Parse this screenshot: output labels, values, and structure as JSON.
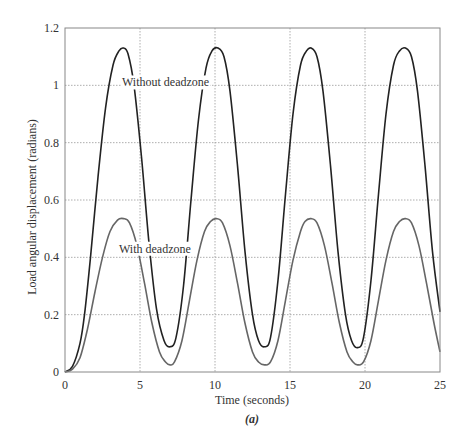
{
  "chart_data": {
    "type": "line",
    "title": "",
    "caption": "(a)",
    "xlabel": "Time (seconds)",
    "ylabel": "Load angular displacement (radians)",
    "xlim": [
      0,
      25
    ],
    "ylim": [
      0,
      1.2
    ],
    "xticks": [
      0,
      5,
      10,
      15,
      20,
      25
    ],
    "xtick_labels": [
      "0",
      "5",
      "10",
      "15",
      "20",
      "25"
    ],
    "yticks": [
      0,
      0.2,
      0.4,
      0.6,
      0.8,
      1.0,
      1.2
    ],
    "ytick_labels": [
      "0",
      "0.2",
      "0.4",
      "0.6",
      "0.8",
      "1",
      "1.2"
    ],
    "grid": true,
    "legend": "inline annotations",
    "annotations": [
      {
        "text": "Without deadzone",
        "x": 3.8,
        "y": 1.01
      },
      {
        "text": "With deadzone",
        "x": 3.6,
        "y": 0.43
      }
    ],
    "series": [
      {
        "name": "Without deadzone",
        "color": "#222222",
        "x": [
          0,
          0.5,
          1.0,
          1.3,
          1.7,
          2.2,
          2.7,
          3.2,
          3.6,
          3.9,
          4.2,
          4.6,
          5.1,
          5.6,
          6.1,
          6.6,
          7.0,
          7.4,
          7.9,
          8.4,
          8.9,
          9.4,
          9.8,
          10.2,
          10.6,
          11.0,
          11.5,
          12.0,
          12.5,
          12.9,
          13.3,
          13.7,
          14.2,
          14.7,
          15.2,
          15.7,
          16.1,
          16.4,
          16.8,
          17.2,
          17.7,
          18.2,
          18.7,
          19.1,
          19.5,
          19.9,
          20.4,
          20.9,
          21.4,
          21.9,
          22.3,
          22.7,
          23.1,
          23.5,
          24.0,
          24.5,
          25.0
        ],
        "y": [
          0,
          0.02,
          0.1,
          0.2,
          0.4,
          0.68,
          0.92,
          1.07,
          1.12,
          1.13,
          1.11,
          1.0,
          0.75,
          0.45,
          0.22,
          0.11,
          0.088,
          0.12,
          0.3,
          0.6,
          0.88,
          1.06,
          1.12,
          1.13,
          1.1,
          0.98,
          0.72,
          0.42,
          0.2,
          0.11,
          0.088,
          0.12,
          0.32,
          0.62,
          0.9,
          1.07,
          1.12,
          1.13,
          1.1,
          0.98,
          0.72,
          0.42,
          0.2,
          0.11,
          0.085,
          0.12,
          0.32,
          0.62,
          0.9,
          1.07,
          1.12,
          1.13,
          1.1,
          0.98,
          0.72,
          0.42,
          0.21
        ]
      },
      {
        "name": "With deadzone",
        "color": "#666666",
        "x": [
          0,
          0.5,
          1.0,
          1.5,
          2.0,
          2.5,
          3.0,
          3.5,
          3.9,
          4.3,
          4.8,
          5.3,
          5.8,
          6.3,
          6.7,
          7.0,
          7.3,
          7.8,
          8.3,
          8.8,
          9.3,
          9.7,
          10.1,
          10.5,
          11.0,
          11.5,
          12.0,
          12.5,
          12.9,
          13.3,
          13.7,
          14.2,
          14.7,
          15.2,
          15.7,
          16.0,
          16.4,
          16.8,
          17.3,
          17.8,
          18.3,
          18.8,
          19.2,
          19.5,
          19.9,
          20.4,
          20.9,
          21.4,
          21.9,
          22.3,
          22.7,
          23.1,
          23.6,
          24.1,
          24.6,
          25.0
        ],
        "y": [
          0,
          0.01,
          0.05,
          0.15,
          0.28,
          0.4,
          0.49,
          0.53,
          0.535,
          0.52,
          0.44,
          0.31,
          0.17,
          0.07,
          0.035,
          0.025,
          0.035,
          0.11,
          0.25,
          0.39,
          0.49,
          0.525,
          0.535,
          0.52,
          0.44,
          0.31,
          0.17,
          0.07,
          0.035,
          0.025,
          0.035,
          0.11,
          0.25,
          0.39,
          0.49,
          0.525,
          0.535,
          0.52,
          0.44,
          0.31,
          0.17,
          0.07,
          0.035,
          0.025,
          0.035,
          0.11,
          0.25,
          0.39,
          0.49,
          0.525,
          0.535,
          0.52,
          0.44,
          0.31,
          0.17,
          0.07
        ]
      }
    ]
  },
  "layout": {
    "plot": {
      "left": 65,
      "top": 28,
      "right": 440,
      "bottom": 372
    }
  }
}
